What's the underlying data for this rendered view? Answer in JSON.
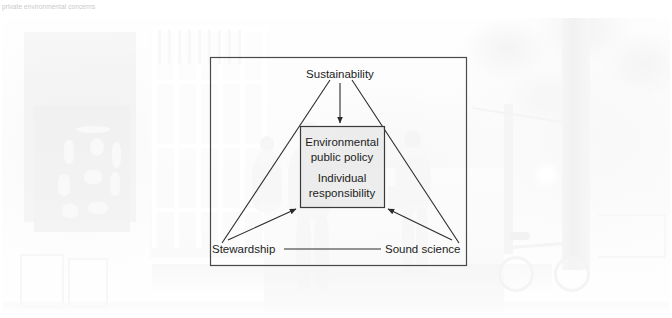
{
  "caption": {
    "text": "private environmental concerns"
  },
  "figure": {
    "photo_alt": "Faded photograph of a tree-lined town street with shop windows, two pedestrians walking away, and a parked bicycle"
  },
  "diagram": {
    "type": "triangle-concept-diagram",
    "frame": {
      "x": 210,
      "y": 57,
      "width": 256,
      "height": 208
    },
    "nodes": [
      {
        "id": "top",
        "label": "Sustainability",
        "x": 340,
        "y": 74,
        "anchor": "middle"
      },
      {
        "id": "left",
        "label": "Stewardship",
        "x": 212,
        "y": 252,
        "anchor": "start"
      },
      {
        "id": "right",
        "label": "Sound science",
        "x": 385,
        "y": 252,
        "anchor": "start"
      }
    ],
    "center_box": {
      "x": 300,
      "y": 126,
      "width": 84,
      "height": 81,
      "lines": [
        "Environmental",
        "public policy",
        "",
        "Individual",
        "responsibility"
      ],
      "line_1": "Environmental",
      "line_2": "public policy",
      "line_3": "Individual",
      "line_4": "responsibility"
    },
    "edges": [
      {
        "from": "top",
        "to": "left",
        "arrow": false
      },
      {
        "from": "top",
        "to": "right",
        "arrow": false
      },
      {
        "from": "left",
        "to": "right",
        "arrow": false
      },
      {
        "from": "top",
        "to": "center_box",
        "arrow": true
      },
      {
        "from": "left",
        "to": "center_box",
        "arrow": true
      },
      {
        "from": "right",
        "to": "center_box",
        "arrow": true
      }
    ],
    "colors": {
      "line": "#2b2b2b",
      "frame": "#4a4a4a",
      "box_fill": "#e9e9e9",
      "text": "#1c1c1c"
    }
  }
}
